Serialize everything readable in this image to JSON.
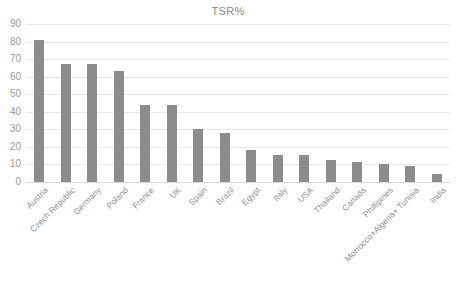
{
  "chart": {
    "title": "TSR%",
    "bar_color": "#8c8c8c",
    "gridline_color": "#e8e8e8",
    "tick_label_color": "#9a9a9a",
    "title_color": "#8a8a8a",
    "background_color": "#ffffff"
  },
  "chart_data": {
    "type": "bar",
    "title": "TSR%",
    "xlabel": "",
    "ylabel": "",
    "ylim": [
      0,
      90
    ],
    "ytick_step": 10,
    "yticks": [
      0,
      10,
      20,
      30,
      40,
      50,
      60,
      70,
      80,
      90
    ],
    "ytick_labels": [
      "0",
      "10",
      "20",
      "30",
      "40",
      "50",
      "60",
      "70",
      "80",
      "90"
    ],
    "grid": true,
    "legend": false,
    "legend_position": "none",
    "orientation": "vertical",
    "categories": [
      "Austria",
      "Czech Republic",
      "Germany",
      "Poland",
      "France",
      "UK",
      "Spain",
      "Brazil",
      "Egypt",
      "Italy",
      "USA",
      "Thailand",
      "Canada",
      "Phillipines",
      "Morrocco+Algeria+ Tunisia",
      "India"
    ],
    "values": [
      81,
      67.5,
      67.5,
      63,
      44,
      44,
      30,
      28,
      18.5,
      15.5,
      15.5,
      12.5,
      11.5,
      10,
      9,
      4.5
    ],
    "series": [
      {
        "name": "TSR%",
        "values": [
          81,
          67.5,
          67.5,
          63,
          44,
          44,
          30,
          28,
          18.5,
          15.5,
          15.5,
          12.5,
          11.5,
          10,
          9,
          4.5
        ]
      }
    ]
  }
}
